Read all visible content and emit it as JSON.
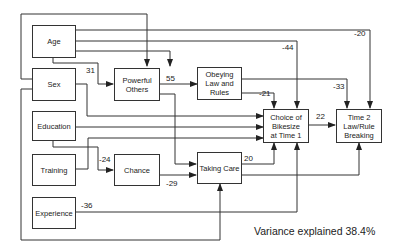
{
  "nodes": {
    "age": "Age",
    "sex": "Sex",
    "education": "Education",
    "training": "Training",
    "experience": "Experience",
    "powerful_others": "Powerful\nOthers",
    "obeying": "Obeying\nLaw and\nRules",
    "chance": "Chance",
    "taking_care": "Taking Care",
    "choice": "Choice of\nBikesize\nat Time 1",
    "time2": "Time 2\nLaw/Rule\nBreaking"
  },
  "path_coefficients": {
    "sex_to_powerful_others": "31",
    "powerful_others_to_obeying": "55",
    "age_to_choice": "-44",
    "age_to_time2": "-20",
    "obeying_to_choice": "-21",
    "obeying_to_time2": "-33",
    "choice_to_time2": "22",
    "education_to_chance": "-24",
    "chance_to_taking_care": "-29",
    "taking_care_to_choice": "20",
    "experience_to_choice": "-36"
  },
  "footer": {
    "variance_text": "Variance explained 38.4%"
  }
}
